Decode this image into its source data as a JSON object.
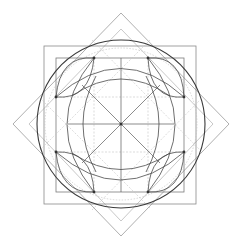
{
  "diagram": {
    "title": "",
    "type": "geometric-construction",
    "center": [
      121,
      124
    ],
    "colors": {
      "background": "#ffffff",
      "main_circle": "#3a3a3a",
      "square_lines": "#7a7a7a",
      "diamond_lines": "#9a9a9a",
      "guide_lines": "#c4c4c4",
      "nodes": "#333333"
    },
    "shapes": {
      "outer_diamond": [
        [
          121,
          13
        ],
        [
          229,
          124
        ],
        [
          121,
          236
        ],
        [
          13,
          124
        ]
      ],
      "inner_diamond": [
        [
          121,
          29
        ],
        [
          213,
          124
        ],
        [
          121,
          221
        ],
        [
          29,
          124
        ]
      ],
      "outer_square": {
        "x": 44,
        "y": 46,
        "w": 152,
        "h": 158
      },
      "inner_square": {
        "x": 56,
        "y": 58,
        "w": 128,
        "h": 134
      },
      "main_circle": {
        "cx": 121,
        "cy": 124,
        "r": 84
      },
      "dotted_circle": {
        "cx": 121,
        "cy": 124,
        "r": 76
      }
    },
    "nodes": [
      [
        94,
        58
      ],
      [
        148,
        58
      ],
      [
        184,
        97
      ],
      [
        184,
        152
      ],
      [
        148,
        192
      ],
      [
        94,
        192
      ],
      [
        56,
        152
      ],
      [
        56,
        97
      ],
      [
        121,
        124
      ]
    ],
    "labels": []
  }
}
